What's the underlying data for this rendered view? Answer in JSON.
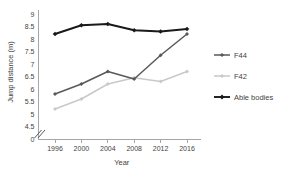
{
  "chart_data": {
    "type": "line",
    "title": "",
    "xlabel": "Year",
    "ylabel": "Jump distance (m)",
    "categories": [
      "1996",
      "2000",
      "2004",
      "2008",
      "2012",
      "2016"
    ],
    "x": [
      1996,
      2000,
      2004,
      2008,
      2012,
      2016
    ],
    "series": [
      {
        "name": "F44",
        "color": "#595959",
        "marker": "diamond",
        "values": [
          5.8,
          6.2,
          6.7,
          6.4,
          7.35,
          8.2
        ]
      },
      {
        "name": "F42",
        "color": "#c9c9c9",
        "marker": "diamond",
        "values": [
          5.2,
          5.6,
          6.2,
          6.45,
          6.3,
          6.7
        ]
      },
      {
        "name": "Able bodies",
        "color": "#1a1a1a",
        "marker": "diamond",
        "values": [
          8.2,
          8.55,
          8.6,
          8.35,
          8.3,
          8.4
        ]
      }
    ],
    "ylim": [
      4.5,
      9.0
    ],
    "yticks": [
      "0",
      "4.5",
      "5",
      "5.5",
      "6",
      "6.5",
      "7",
      "7.5",
      "8",
      "8.5",
      "9"
    ],
    "ytick_values": [
      4.5,
      5,
      5.5,
      6,
      6.5,
      7,
      7.5,
      8,
      8.5,
      9
    ],
    "zero_tick_label": "0",
    "axis_break": true,
    "grid": false,
    "legend_position": "right",
    "legend_entries": [
      "F44",
      "F42",
      "Able bodies"
    ]
  },
  "axes": {
    "y_title": "Jump distance (m)",
    "x_title": "Year"
  },
  "legend": {
    "items": [
      {
        "label": "F44"
      },
      {
        "label": "F42"
      },
      {
        "label": "Able bodies"
      }
    ]
  },
  "ticks": {
    "y": [
      "9",
      "8.5",
      "8",
      "7.5",
      "7",
      "6.5",
      "6",
      "5.5",
      "5",
      "4.5",
      "0"
    ],
    "x": [
      "1996",
      "2000",
      "2004",
      "2008",
      "2012",
      "2016"
    ]
  }
}
